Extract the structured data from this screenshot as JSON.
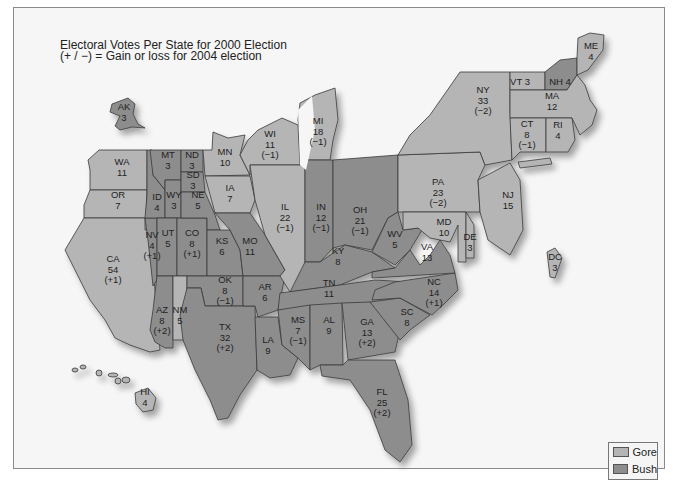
{
  "title": {
    "line1": "Electoral Votes Per State for 2000 Election",
    "line2": "(+ / −) = Gain or loss for 2004 election"
  },
  "legend": {
    "items": [
      {
        "label": "Gore",
        "color": "#b5b5b5"
      },
      {
        "label": "Bush",
        "color": "#8d8d8d"
      }
    ]
  },
  "colors": {
    "gore": "#b5b5b5",
    "bush": "#8d8d8d",
    "border": "#3a3a3a",
    "background": "#f6f6f6"
  },
  "chart_data": {
    "type": "map",
    "title": "Electoral Votes Per State for 2000 Election",
    "subtitle": "(+ / −) = Gain or loss for 2004 election",
    "legend": [
      "Gore",
      "Bush"
    ],
    "states": [
      {
        "abbr": "AK",
        "votes": 3,
        "change": null,
        "winner": "Bush"
      },
      {
        "abbr": "HI",
        "votes": 4,
        "change": null,
        "winner": "Gore"
      },
      {
        "abbr": "WA",
        "votes": 11,
        "change": null,
        "winner": "Gore"
      },
      {
        "abbr": "OR",
        "votes": 7,
        "change": null,
        "winner": "Gore"
      },
      {
        "abbr": "CA",
        "votes": 54,
        "change": "+1",
        "winner": "Gore"
      },
      {
        "abbr": "NV",
        "votes": 4,
        "change": "+1",
        "winner": "Bush"
      },
      {
        "abbr": "ID",
        "votes": 4,
        "change": null,
        "winner": "Bush"
      },
      {
        "abbr": "MT",
        "votes": 3,
        "change": null,
        "winner": "Bush"
      },
      {
        "abbr": "WY",
        "votes": 3,
        "change": null,
        "winner": "Bush"
      },
      {
        "abbr": "UT",
        "votes": 5,
        "change": null,
        "winner": "Bush"
      },
      {
        "abbr": "AZ",
        "votes": 8,
        "change": "+2",
        "winner": "Bush"
      },
      {
        "abbr": "CO",
        "votes": 8,
        "change": "+1",
        "winner": "Bush"
      },
      {
        "abbr": "NM",
        "votes": 5,
        "change": null,
        "winner": "Gore"
      },
      {
        "abbr": "ND",
        "votes": 3,
        "change": null,
        "winner": "Bush"
      },
      {
        "abbr": "SD",
        "votes": 3,
        "change": null,
        "winner": "Bush"
      },
      {
        "abbr": "NE",
        "votes": 5,
        "change": null,
        "winner": "Bush"
      },
      {
        "abbr": "KS",
        "votes": 6,
        "change": null,
        "winner": "Bush"
      },
      {
        "abbr": "OK",
        "votes": 8,
        "change": "-1",
        "winner": "Bush"
      },
      {
        "abbr": "TX",
        "votes": 32,
        "change": "+2",
        "winner": "Bush"
      },
      {
        "abbr": "MN",
        "votes": 10,
        "change": null,
        "winner": "Gore"
      },
      {
        "abbr": "IA",
        "votes": 7,
        "change": null,
        "winner": "Gore"
      },
      {
        "abbr": "MO",
        "votes": 11,
        "change": null,
        "winner": "Bush"
      },
      {
        "abbr": "AR",
        "votes": 6,
        "change": null,
        "winner": "Bush"
      },
      {
        "abbr": "LA",
        "votes": 9,
        "change": null,
        "winner": "Bush"
      },
      {
        "abbr": "WI",
        "votes": 11,
        "change": "-1",
        "winner": "Gore"
      },
      {
        "abbr": "IL",
        "votes": 22,
        "change": "-1",
        "winner": "Gore"
      },
      {
        "abbr": "MI",
        "votes": 18,
        "change": "-1",
        "winner": "Gore"
      },
      {
        "abbr": "IN",
        "votes": 12,
        "change": "-1",
        "winner": "Bush"
      },
      {
        "abbr": "OH",
        "votes": 21,
        "change": "-1",
        "winner": "Bush"
      },
      {
        "abbr": "KY",
        "votes": 8,
        "change": null,
        "winner": "Bush"
      },
      {
        "abbr": "TN",
        "votes": 11,
        "change": null,
        "winner": "Bush"
      },
      {
        "abbr": "MS",
        "votes": 7,
        "change": "-1",
        "winner": "Bush"
      },
      {
        "abbr": "AL",
        "votes": 9,
        "change": null,
        "winner": "Bush"
      },
      {
        "abbr": "GA",
        "votes": 13,
        "change": "+2",
        "winner": "Bush"
      },
      {
        "abbr": "FL",
        "votes": 25,
        "change": "+2",
        "winner": "Bush"
      },
      {
        "abbr": "SC",
        "votes": 8,
        "change": null,
        "winner": "Bush"
      },
      {
        "abbr": "NC",
        "votes": 14,
        "change": "+1",
        "winner": "Bush"
      },
      {
        "abbr": "VA",
        "votes": 13,
        "change": null,
        "winner": "Bush"
      },
      {
        "abbr": "WV",
        "votes": 5,
        "change": null,
        "winner": "Bush"
      },
      {
        "abbr": "MD",
        "votes": 10,
        "change": null,
        "winner": "Gore"
      },
      {
        "abbr": "DE",
        "votes": 3,
        "change": null,
        "winner": "Gore"
      },
      {
        "abbr": "DC",
        "votes": 3,
        "change": null,
        "winner": "Gore"
      },
      {
        "abbr": "PA",
        "votes": 23,
        "change": "-2",
        "winner": "Gore"
      },
      {
        "abbr": "NJ",
        "votes": 15,
        "change": null,
        "winner": "Gore"
      },
      {
        "abbr": "NY",
        "votes": 33,
        "change": "-2",
        "winner": "Gore"
      },
      {
        "abbr": "CT",
        "votes": 8,
        "change": "-1",
        "winner": "Gore"
      },
      {
        "abbr": "RI",
        "votes": 4,
        "change": null,
        "winner": "Gore"
      },
      {
        "abbr": "MA",
        "votes": 12,
        "change": null,
        "winner": "Gore"
      },
      {
        "abbr": "VT",
        "votes": 3,
        "change": null,
        "winner": "Gore"
      },
      {
        "abbr": "NH",
        "votes": 4,
        "change": null,
        "winner": "Bush"
      },
      {
        "abbr": "ME",
        "votes": 4,
        "change": null,
        "winner": "Gore"
      }
    ]
  },
  "labels": {
    "AK": [
      "AK",
      "3"
    ],
    "HI": [
      "HI",
      "4"
    ],
    "WA": [
      "WA",
      "11"
    ],
    "OR": [
      "OR",
      "7"
    ],
    "CA": [
      "CA",
      "54",
      "(+1)"
    ],
    "NV": [
      "NV",
      "4",
      "(+1)"
    ],
    "ID": [
      "ID",
      "4"
    ],
    "MT": [
      "MT",
      "3"
    ],
    "WY": [
      "WY",
      "3"
    ],
    "UT": [
      "UT",
      "5"
    ],
    "AZ": [
      "AZ",
      "8",
      "(+2)"
    ],
    "CO": [
      "CO",
      "8",
      "(+1)"
    ],
    "NM": [
      "NM",
      "5"
    ],
    "ND": [
      "ND",
      "3"
    ],
    "SD": [
      "SD",
      "3"
    ],
    "NE": [
      "NE",
      "5"
    ],
    "KS": [
      "KS",
      "6"
    ],
    "OK": [
      "OK",
      "8",
      "(−1)"
    ],
    "TX": [
      "TX",
      "32",
      "(+2)"
    ],
    "MN": [
      "MN",
      "10"
    ],
    "IA": [
      "IA",
      "7"
    ],
    "MO": [
      "MO",
      "11"
    ],
    "AR": [
      "AR",
      "6"
    ],
    "LA": [
      "LA",
      "9"
    ],
    "WI": [
      "WI",
      "11",
      "(−1)"
    ],
    "IL": [
      "IL",
      "22",
      "(−1)"
    ],
    "MI": [
      "MI",
      "18",
      "(−1)"
    ],
    "IN": [
      "IN",
      "12",
      "(−1)"
    ],
    "OH": [
      "OH",
      "21",
      "(−1)"
    ],
    "KY": [
      "KY",
      "8"
    ],
    "TN": [
      "TN",
      "11"
    ],
    "MS": [
      "MS",
      "7",
      "(−1)"
    ],
    "AL": [
      "AL",
      "9"
    ],
    "GA": [
      "GA",
      "13",
      "(+2)"
    ],
    "FL": [
      "FL",
      "25",
      "(+2)"
    ],
    "SC": [
      "SC",
      "8"
    ],
    "NC": [
      "NC",
      "14",
      "(+1)"
    ],
    "VA": [
      "VA",
      "13"
    ],
    "WV": [
      "WV",
      "5"
    ],
    "MD": [
      "MD",
      "10"
    ],
    "DE": [
      "DE",
      "3"
    ],
    "DC": [
      "DC",
      "3"
    ],
    "PA": [
      "PA",
      "23",
      "(−2)"
    ],
    "NJ": [
      "NJ",
      "15"
    ],
    "NY": [
      "NY",
      "33",
      "(−2)"
    ],
    "CT": [
      "CT",
      "8",
      "(−1)"
    ],
    "RI": [
      "RI",
      "4"
    ],
    "MA": [
      "MA",
      "12"
    ],
    "VT": [
      "VT 3"
    ],
    "NH": [
      "NH 4"
    ],
    "ME": [
      "ME",
      "4"
    ]
  }
}
